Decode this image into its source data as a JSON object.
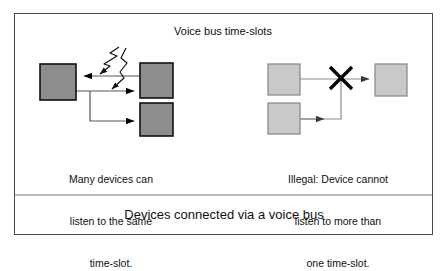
{
  "figure": {
    "bus_title": "Voice bus time-slots",
    "caption": "Devices connected via a voice bus",
    "frame_color": "#4a4a4a",
    "background_color": "#ffffff",
    "line_color": "#555555",
    "arrow_color": "#000000"
  },
  "left_panel": {
    "caption_lines": [
      "Many devices can",
      "listen to the same",
      "time-slot."
    ],
    "box_fill": "#8d8d8d",
    "box_stroke": "#111111",
    "devices": [
      {
        "name": "listener-device",
        "x": 40,
        "y": 64,
        "w": 36,
        "h": 36
      },
      {
        "name": "talker-device",
        "x": 140,
        "y": 63,
        "w": 33,
        "h": 35
      },
      {
        "name": "second-listener-device",
        "x": 140,
        "y": 103,
        "w": 33,
        "h": 33
      }
    ]
  },
  "right_panel": {
    "caption_lines": [
      "Illegal: Device cannot",
      "listen to more than",
      "one time-slot."
    ],
    "box_fill": "#c9c9c9",
    "box_stroke": "#8c8c8c",
    "forbidden_marker": "X",
    "devices": [
      {
        "name": "source-device-a",
        "x": 268,
        "y": 64,
        "w": 32,
        "h": 31
      },
      {
        "name": "source-device-b",
        "x": 268,
        "y": 103,
        "w": 32,
        "h": 31
      },
      {
        "name": "target-device",
        "x": 375,
        "y": 64,
        "w": 32,
        "h": 32
      }
    ]
  }
}
